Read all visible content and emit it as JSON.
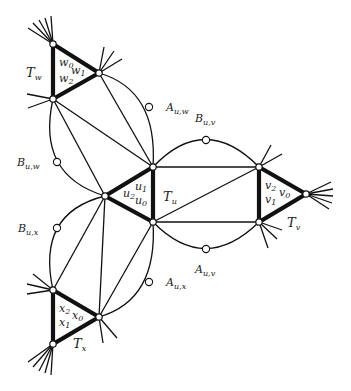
{
  "figure": {
    "colors": {
      "stroke": "#111111",
      "vertex_fill": "#ffffff",
      "background": "#ffffff"
    }
  },
  "triangles": [
    {
      "name": "T",
      "sub": "w",
      "vertex_labels": [
        {
          "base": "w",
          "sub": "0"
        },
        {
          "base": "w",
          "sub": "1"
        },
        {
          "base": "w",
          "sub": "2"
        }
      ]
    },
    {
      "name": "T",
      "sub": "u",
      "vertex_labels": [
        {
          "base": "u",
          "sub": "1"
        },
        {
          "base": "u",
          "sub": "2"
        },
        {
          "base": "u",
          "sub": "0"
        }
      ]
    },
    {
      "name": "T",
      "sub": "v",
      "vertex_labels": [
        {
          "base": "v",
          "sub": "2"
        },
        {
          "base": "v",
          "sub": "0"
        },
        {
          "base": "v",
          "sub": "1"
        }
      ]
    },
    {
      "name": "T",
      "sub": "x",
      "vertex_labels": [
        {
          "base": "x",
          "sub": "2"
        },
        {
          "base": "x",
          "sub": "0"
        },
        {
          "base": "x",
          "sub": "1"
        }
      ]
    }
  ],
  "subdivision_labels": [
    {
      "base": "A",
      "sub": "u,w"
    },
    {
      "base": "B",
      "sub": "u,v"
    },
    {
      "base": "B",
      "sub": "u,w"
    },
    {
      "base": "B",
      "sub": "u,x"
    },
    {
      "base": "A",
      "sub": "u,v"
    },
    {
      "base": "A",
      "sub": "u,x"
    }
  ]
}
